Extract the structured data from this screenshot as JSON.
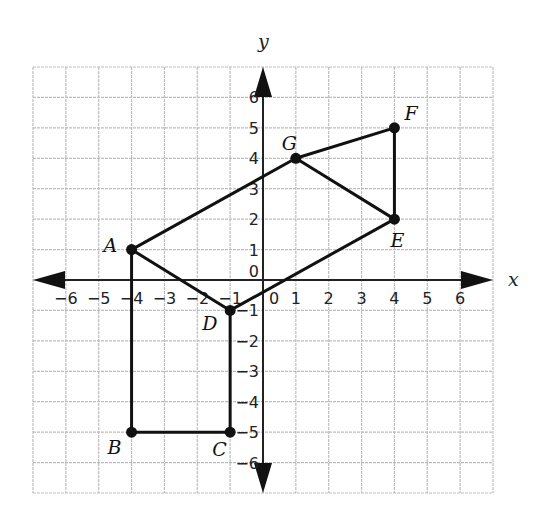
{
  "chart_data": {
    "type": "scatter",
    "title": "",
    "xlabel": "x",
    "ylabel": "y",
    "xlim": [
      -7,
      7
    ],
    "ylim": [
      -7,
      7
    ],
    "grid": true,
    "x_ticks": [
      -6,
      -5,
      -4,
      -3,
      -2,
      -1,
      0,
      1,
      2,
      3,
      4,
      5,
      6
    ],
    "y_ticks": [
      -6,
      -5,
      -4,
      -3,
      -2,
      -1,
      0,
      1,
      2,
      3,
      4,
      5,
      6
    ],
    "points": [
      {
        "label": "A",
        "x": -4,
        "y": 1
      },
      {
        "label": "B",
        "x": -4,
        "y": -5
      },
      {
        "label": "C",
        "x": -1,
        "y": -5
      },
      {
        "label": "D",
        "x": -1,
        "y": -1
      },
      {
        "label": "E",
        "x": 4,
        "y": 2
      },
      {
        "label": "F",
        "x": 4,
        "y": 5
      },
      {
        "label": "G",
        "x": 1,
        "y": 4
      }
    ],
    "segments": [
      [
        "A",
        "B"
      ],
      [
        "B",
        "C"
      ],
      [
        "C",
        "D"
      ],
      [
        "D",
        "A"
      ],
      [
        "A",
        "G"
      ],
      [
        "G",
        "F"
      ],
      [
        "F",
        "E"
      ],
      [
        "E",
        "G"
      ],
      [
        "E",
        "D"
      ]
    ]
  },
  "labels": {
    "x_axis": "x",
    "y_axis": "y"
  }
}
